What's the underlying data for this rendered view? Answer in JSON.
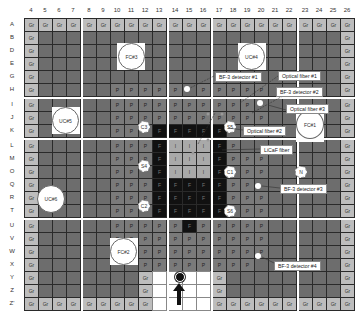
{
  "columns": [
    "4",
    "5",
    "6",
    "7",
    "8",
    "9",
    "10",
    "11",
    "12",
    "13",
    "14",
    "15",
    "16",
    "17",
    "18",
    "19",
    "20",
    "21",
    "22",
    "23",
    "24",
    "25",
    "26"
  ],
  "rows": [
    "A",
    "B",
    "D",
    "E",
    "G",
    "H",
    "I",
    "J",
    "K",
    "L",
    "M",
    "O",
    "Q",
    "R",
    "T",
    "U",
    "V",
    "W",
    "X",
    "Y",
    "Z",
    "Z'"
  ],
  "legend_codes": {
    "Gr": "graphite",
    "P": "P",
    "F": "F",
    "I": "I"
  },
  "grid": {
    "A": [
      "Gr",
      "Gr",
      "Gr",
      "Gr",
      "Gr",
      "Gr",
      "Gr",
      "Gr",
      "Gr",
      "Gr",
      "Gr",
      "Gr",
      "Gr",
      "Gr",
      "Gr",
      "Gr",
      "Gr",
      "Gr",
      "Gr",
      "Gr",
      "Gr",
      "Gr",
      "Gr"
    ],
    "B": [
      "Gr",
      "",
      "",
      "",
      "",
      "",
      "",
      "",
      "",
      "",
      "",
      "",
      "",
      "",
      "",
      "",
      "",
      "",
      "",
      "",
      "",
      "",
      "Gr"
    ],
    "D": [
      "Gr",
      "",
      "",
      "",
      "",
      "",
      "",
      "",
      "",
      "",
      "",
      "",
      "",
      "",
      "",
      "",
      "",
      "",
      "",
      "",
      "",
      "",
      "Gr"
    ],
    "E": [
      "Gr",
      "",
      "",
      "",
      "",
      "",
      "",
      "",
      "",
      "",
      "",
      "",
      "",
      "",
      "",
      "",
      "",
      "",
      "",
      "",
      "",
      "",
      "Gr"
    ],
    "G": [
      "Gr",
      "",
      "",
      "",
      "",
      "",
      "",
      "",
      "",
      "",
      "",
      "",
      "",
      "",
      "",
      "",
      "",
      "",
      "",
      "",
      "",
      "",
      "Gr"
    ],
    "H": [
      "Gr",
      "",
      "",
      "",
      "",
      "",
      "P",
      "P",
      "P",
      "P",
      "P",
      "",
      "P",
      "P",
      "P",
      "P",
      "P",
      "",
      "",
      "",
      "",
      "",
      "Gr"
    ],
    "I": [
      "Gr",
      "",
      "",
      "",
      "",
      "",
      "P",
      "P",
      "P",
      "P",
      "P",
      "P",
      "P",
      "P",
      "P",
      "P",
      "",
      "",
      "",
      "",
      "",
      "",
      "Gr"
    ],
    "J": [
      "Gr",
      "",
      "",
      "",
      "",
      "",
      "P",
      "P",
      "P",
      "P",
      "P",
      "P",
      "P",
      "P",
      "P",
      "P",
      "P",
      "",
      "",
      "",
      "",
      "",
      "Gr"
    ],
    "K": [
      "Gr",
      "",
      "",
      "",
      "",
      "",
      "P",
      "P",
      "",
      "F",
      "F",
      "F",
      "F",
      "F",
      "",
      "P",
      "",
      "",
      "",
      "",
      "",
      "",
      "Gr"
    ],
    "L": [
      "Gr",
      "",
      "",
      "",
      "",
      "",
      "P",
      "P",
      "P",
      "F",
      "I",
      "I",
      "I",
      "F",
      "P",
      "",
      "",
      "",
      "",
      "",
      "",
      "",
      "Gr"
    ],
    "M": [
      "Gr",
      "",
      "",
      "",
      "",
      "",
      "P",
      "P",
      "P",
      "F",
      "I",
      "I",
      "I",
      "F",
      "P",
      "P",
      "P",
      "",
      "",
      "",
      "",
      "",
      "Gr"
    ],
    "O": [
      "Gr",
      "",
      "",
      "",
      "",
      "",
      "P",
      "P",
      "",
      "F",
      "I",
      "I",
      "I",
      "F",
      "",
      "P",
      "P",
      "",
      "",
      "",
      "",
      "",
      "Gr"
    ],
    "Q": [
      "Gr",
      "",
      "",
      "",
      "",
      "",
      "P",
      "P",
      "P",
      "F",
      "F",
      "F",
      "F",
      "F",
      "P",
      "P",
      "",
      "",
      "",
      "",
      "",
      "",
      "Gr"
    ],
    "R": [
      "Gr",
      "",
      "",
      "",
      "",
      "",
      "P",
      "P",
      "P",
      "F",
      "F",
      "F",
      "F",
      "F",
      "P",
      "P",
      "P",
      "",
      "",
      "",
      "",
      "",
      "Gr"
    ],
    "T": [
      "Gr",
      "",
      "",
      "",
      "",
      "",
      "P",
      "P",
      "",
      "F",
      "F",
      "F",
      "F",
      "F",
      "",
      "P",
      "P",
      "",
      "",
      "",
      "",
      "",
      "Gr"
    ],
    "U": [
      "Gr",
      "",
      "",
      "",
      "",
      "",
      "P",
      "P",
      "P",
      "P",
      "P",
      "F",
      "P",
      "P",
      "P",
      "P",
      "P",
      "",
      "",
      "",
      "",
      "",
      "Gr"
    ],
    "V": [
      "Gr",
      "",
      "",
      "",
      "",
      "",
      "P",
      "P",
      "P",
      "P",
      "P",
      "P",
      "P",
      "P",
      "P",
      "P",
      "P",
      "",
      "",
      "",
      "",
      "",
      "Gr"
    ],
    "W": [
      "Gr",
      "",
      "",
      "",
      "",
      "",
      "",
      "",
      "P",
      "P",
      "P",
      "P",
      "P",
      "P",
      "P",
      "P",
      "P",
      "",
      "",
      "",
      "",
      "",
      "Gr"
    ],
    "X": [
      "Gr",
      "",
      "",
      "",
      "",
      "",
      "",
      "",
      "P",
      "P",
      "P",
      "P",
      "P",
      "P",
      "P",
      "P",
      "",
      "",
      "",
      "",
      "",
      "",
      "Gr"
    ],
    "Y": [
      "Gr",
      "",
      "",
      "",
      "",
      "",
      "",
      "",
      "Gr",
      "W",
      "W",
      "W",
      "W",
      "Gr",
      "",
      "",
      "",
      "",
      "",
      "",
      "",
      "",
      "Gr"
    ],
    "Z": [
      "Gr",
      "",
      "",
      "",
      "",
      "",
      "",
      "",
      "Gr",
      "W",
      "W",
      "W",
      "W",
      "Gr",
      "",
      "",
      "",
      "",
      "",
      "",
      "",
      "",
      "Gr"
    ],
    "Z'": [
      "Gr",
      "Gr",
      "Gr",
      "Gr",
      "Gr",
      "Gr",
      "Gr",
      "Gr",
      "Gr",
      "W",
      "W",
      "W",
      "W",
      "Gr",
      "Gr",
      "Gr",
      "Gr",
      "Gr",
      "Gr",
      "Gr",
      "Gr",
      "Gr",
      "Gr"
    ]
  },
  "large_channels": [
    {
      "id": "fc3",
      "label": "FC#3"
    },
    {
      "id": "uc4",
      "label": "UC#4"
    },
    {
      "id": "uc5",
      "label": "UC#5"
    },
    {
      "id": "fc1",
      "label": "FC#1"
    },
    {
      "id": "uc6",
      "label": "UC#6"
    },
    {
      "id": "fc2",
      "label": "FC#2"
    }
  ],
  "small_channels": [
    {
      "id": "c3",
      "label": "C3"
    },
    {
      "id": "s5",
      "label": "S5"
    },
    {
      "id": "s4",
      "label": "S4"
    },
    {
      "id": "c1",
      "label": "C1"
    },
    {
      "id": "n",
      "label": "N"
    },
    {
      "id": "c2",
      "label": "C2"
    },
    {
      "id": "s6",
      "label": "S6"
    }
  ],
  "callouts": [
    {
      "id": "bf3-1",
      "label": "BF-3 detector #1"
    },
    {
      "id": "of1",
      "label": "Optical fiber #1"
    },
    {
      "id": "bf3-2",
      "label": "BF-3 detector #2"
    },
    {
      "id": "of3",
      "label": "Optical fiber #3"
    },
    {
      "id": "of2",
      "label": "Optical fiber #2"
    },
    {
      "id": "licaf",
      "label": "LiCaF fiber"
    },
    {
      "id": "bf3-3",
      "label": "BF-3 detector #3"
    },
    {
      "id": "bf3-4",
      "label": "BF-3 detector #4"
    }
  ],
  "colors": {
    "graphite": "#bdbdbd",
    "dark": "#6d6d6d",
    "fuel_p": "#7a7a7a",
    "fuel_f": "#111111",
    "inner_i": "#a9a9a9",
    "gap": "#ffffff"
  }
}
